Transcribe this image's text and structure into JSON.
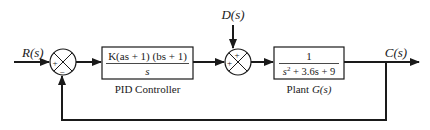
{
  "diagram": {
    "colors": {
      "line": "#1a1a1a",
      "background": "#ffffff"
    },
    "signals": {
      "input": "R(s)",
      "disturbance": "D(s)",
      "output": "C(s)"
    },
    "summing_junctions": [
      {
        "id": "sum1",
        "signs": {
          "left": "+",
          "bottom": "−"
        }
      },
      {
        "id": "sum2",
        "signs": {
          "top": "+",
          "left": "+"
        }
      }
    ],
    "blocks": {
      "controller": {
        "numerator": "K(as + 1) (bs + 1)",
        "denominator": "s",
        "label": "PID Controller"
      },
      "plant": {
        "numerator": "1",
        "denominator_s": "s",
        "denominator_exp": "2",
        "denominator_rest": " + 3.6s + 9",
        "label_prefix": "Plant ",
        "label_fn": "G(s)"
      }
    }
  }
}
